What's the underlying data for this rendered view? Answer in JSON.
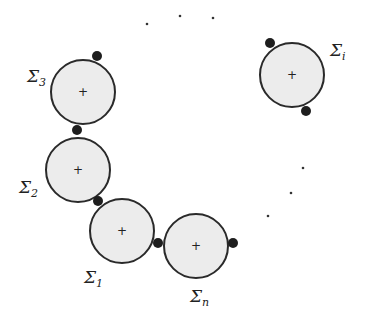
{
  "diagram": {
    "colors": {
      "fill": "#ececec",
      "stroke": "#2a2a2a",
      "dot": "#1e1e1e",
      "text": "#222222"
    },
    "circles": [
      {
        "id": "sigma-3",
        "cx": 83,
        "cy": 92,
        "r": 32,
        "label": "Σ",
        "sub": "3",
        "lx": 28,
        "ly": 80
      },
      {
        "id": "sigma-2",
        "cx": 78,
        "cy": 170,
        "r": 32,
        "label": "Σ",
        "sub": "2",
        "lx": 20,
        "ly": 191
      },
      {
        "id": "sigma-1",
        "cx": 122,
        "cy": 231,
        "r": 32,
        "label": "Σ",
        "sub": "1",
        "lx": 84,
        "ly": 282
      },
      {
        "id": "sigma-n",
        "cx": 196,
        "cy": 246,
        "r": 32,
        "label": "Σ",
        "sub": "n",
        "lx": 191,
        "ly": 300
      },
      {
        "id": "sigma-i",
        "cx": 292,
        "cy": 75,
        "r": 32,
        "label": "Σ",
        "sub": "i",
        "lx": 330,
        "ly": 55
      }
    ],
    "contact_points": [
      {
        "x": 97,
        "y": 56
      },
      {
        "x": 77,
        "y": 130
      },
      {
        "x": 98,
        "y": 201
      },
      {
        "x": 158,
        "y": 243
      },
      {
        "x": 233,
        "y": 243
      },
      {
        "x": 270,
        "y": 43
      },
      {
        "x": 306,
        "y": 111
      }
    ],
    "ellipsis_dots": [
      {
        "x": 147,
        "y": 24
      },
      {
        "x": 180,
        "y": 16
      },
      {
        "x": 213,
        "y": 18
      },
      {
        "x": 303,
        "y": 168
      },
      {
        "x": 291,
        "y": 193
      },
      {
        "x": 268,
        "y": 216
      }
    ],
    "labels": {
      "sigma_3": "Σ",
      "sigma_3_sub": "3",
      "sigma_2": "Σ",
      "sigma_2_sub": "2",
      "sigma_1": "Σ",
      "sigma_1_sub": "1",
      "sigma_n": "Σ",
      "sigma_n_sub": "n",
      "sigma_i": "Σ",
      "sigma_i_sub": "i",
      "center_mark": "+"
    }
  }
}
